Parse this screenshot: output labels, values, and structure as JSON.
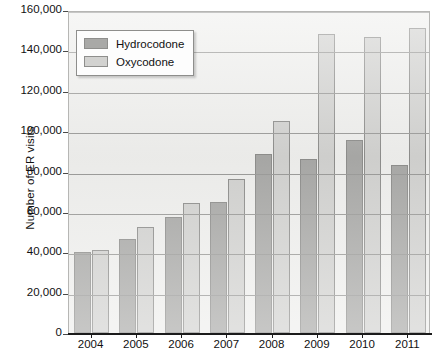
{
  "chart_data": {
    "type": "bar",
    "title": "",
    "xlabel": "",
    "ylabel": "Number of ER visits",
    "categories": [
      "2004",
      "2005",
      "2006",
      "2007",
      "2008",
      "2009",
      "2010",
      "2011"
    ],
    "series": [
      {
        "name": "Hydrocodone",
        "color": "#a9a9a7",
        "values": [
          40000,
          46500,
          57500,
          65000,
          88500,
          86000,
          95500,
          83000
        ]
      },
      {
        "name": "Oxycodone",
        "color": "#d2d2d0",
        "values": [
          41000,
          52500,
          64500,
          76500,
          105000,
          148000,
          146500,
          151000
        ]
      }
    ],
    "ylim": [
      0,
      160000
    ],
    "ytick_values": [
      0,
      20000,
      40000,
      60000,
      80000,
      100000,
      120000,
      140000,
      160000
    ],
    "ytick_labels": [
      "0",
      "20,000",
      "40,000",
      "60,000",
      "80,000",
      "100,000",
      "120,000",
      "140,000",
      "160,000"
    ],
    "grid": true,
    "legend_position": "upper left",
    "legend_entries": [
      "Hydrocodone",
      "Oxycodone"
    ],
    "plot_background": "#efefed",
    "gridline_color": "#9a9a98"
  }
}
